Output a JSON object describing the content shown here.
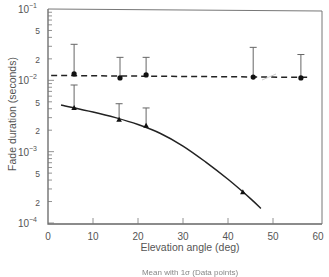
{
  "chart_data": {
    "type": "scatter",
    "title": "",
    "xlabel": "Elevation angle (deg)",
    "ylabel": "Fade duration (seconds)",
    "caption": "Mean with 1σ (Data points)",
    "xlim": [
      0,
      60
    ],
    "ylim": [
      0.0001,
      0.1
    ],
    "yscale": "log",
    "grid": false,
    "legend": null,
    "x_ticks": [
      0,
      10,
      20,
      30,
      40,
      50,
      60
    ],
    "y_ticks": [
      {
        "value": 0.1,
        "label": "10",
        "exp": "-1",
        "major": true
      },
      {
        "value": 0.05,
        "label": "5",
        "major": false
      },
      {
        "value": 0.02,
        "label": "2",
        "major": false
      },
      {
        "value": 0.01,
        "label": "10",
        "exp": "-2",
        "major": true
      },
      {
        "value": 0.005,
        "label": "5",
        "major": false
      },
      {
        "value": 0.002,
        "label": "2",
        "major": false
      },
      {
        "value": 0.001,
        "label": "10",
        "exp": "-3",
        "major": true
      },
      {
        "value": 0.0005,
        "label": "5",
        "major": false
      },
      {
        "value": 0.0002,
        "label": "2",
        "major": false
      },
      {
        "value": 0.0001,
        "label": "10",
        "exp": "-4",
        "major": true
      }
    ],
    "series": [
      {
        "name": "circles (dashed fit)",
        "marker": "circle",
        "points": [
          {
            "x": 5.8,
            "y": 0.0123,
            "err_top": 0.032
          },
          {
            "x": 16.0,
            "y": 0.0108,
            "err_top": 0.021
          },
          {
            "x": 21.8,
            "y": 0.0119,
            "err_top": 0.021
          },
          {
            "x": 45.6,
            "y": 0.0111,
            "err_top": 0.029
          },
          {
            "x": 56.2,
            "y": 0.0108,
            "err_top": 0.023
          }
        ],
        "fit": {
          "style": "dashed",
          "x": [
            0.7,
            58.4
          ],
          "y": [
            0.0117,
            0.011
          ]
        }
      },
      {
        "name": "triangles (solid fit)",
        "marker": "triangle",
        "points": [
          {
            "x": 5.8,
            "y": 0.0041,
            "err_top": 0.0086
          },
          {
            "x": 15.8,
            "y": 0.0028,
            "err_top": 0.0047
          },
          {
            "x": 21.8,
            "y": 0.0023,
            "err_top": 0.0041
          },
          {
            "x": 43.3,
            "y": 0.00027,
            "err_top": null
          }
        ],
        "fit": {
          "style": "solid",
          "x": [
            2.9,
            10,
            15,
            20,
            25,
            30,
            35,
            40,
            45,
            47.3
          ],
          "y": [
            0.0045,
            0.0036,
            0.003,
            0.0024,
            0.0018,
            0.0012,
            0.00072,
            0.00041,
            0.00022,
            0.00016
          ]
        }
      }
    ]
  }
}
